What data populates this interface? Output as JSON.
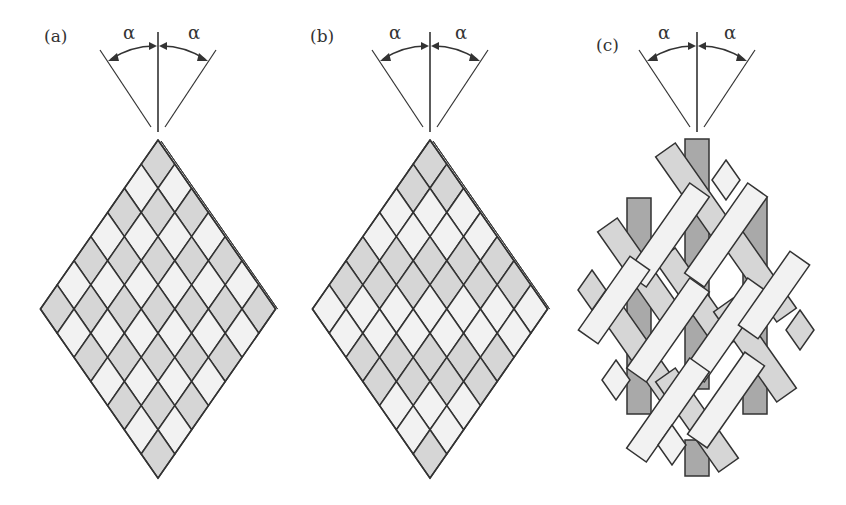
{
  "figure": {
    "angle_symbol": "α",
    "colors": {
      "line": "#333333",
      "tow_light": "#f2f2f2",
      "tow_mid": "#d6d6d6",
      "tow_dark": "#a9a9a9",
      "background": "#ffffff"
    },
    "panels": [
      {
        "label": "(a)",
        "name": "diamond braid (1/1)",
        "alpha_left": "α",
        "alpha_right": "α"
      },
      {
        "label": "(b)",
        "name": "regular braid (2/2)",
        "alpha_left": "α",
        "alpha_right": "α"
      },
      {
        "label": "(c)",
        "name": "triaxial braid",
        "alpha_left": "α",
        "alpha_right": "α"
      }
    ]
  }
}
